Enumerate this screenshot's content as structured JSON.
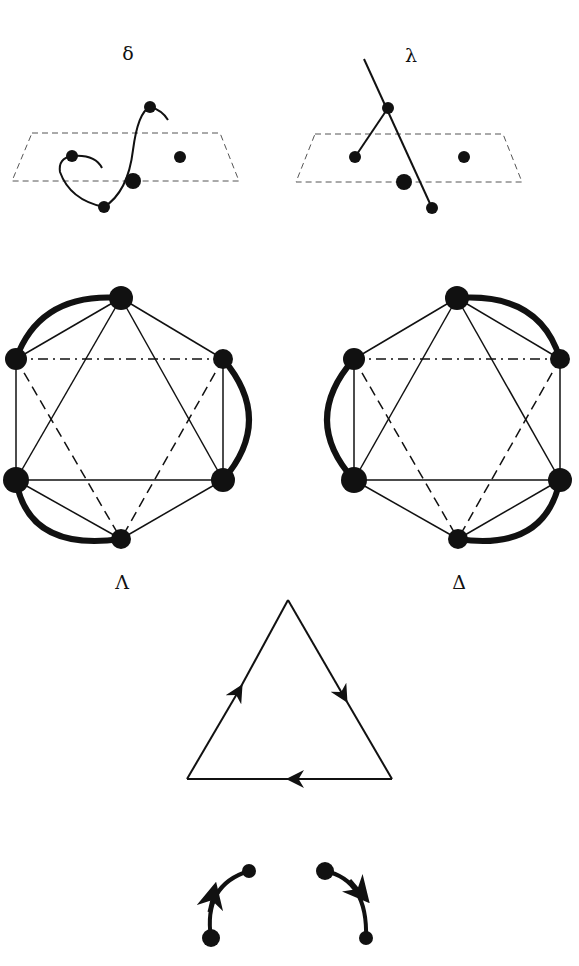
{
  "labels": {
    "delta_small": "δ",
    "lambda_small": "λ",
    "lambda_capital": "Λ",
    "delta_capital": "Δ"
  },
  "figure": {
    "panels": [
      {
        "id": "delta-configuration",
        "label": "δ",
        "description": "Curved chain through dashed plane with atoms"
      },
      {
        "id": "lambda-configuration",
        "label": "λ",
        "description": "Straight chain through dashed plane with atoms"
      },
      {
        "id": "Lambda-octahedron",
        "label": "Λ",
        "description": "Octahedral complex with three bidentate chelate arcs (left-handed)"
      },
      {
        "id": "Delta-octahedron",
        "label": "Δ",
        "description": "Octahedral complex with three bidentate chelate arcs (right-handed)"
      },
      {
        "id": "triangle-circuit",
        "label": "",
        "description": "Triangle with directional arrows (clockwise)"
      },
      {
        "id": "chelate-arcs",
        "label": "",
        "description": "Two arrowed chelate arcs"
      }
    ]
  },
  "colors": {
    "ink": "#111111",
    "dash": "#555555",
    "background": "#ffffff"
  }
}
